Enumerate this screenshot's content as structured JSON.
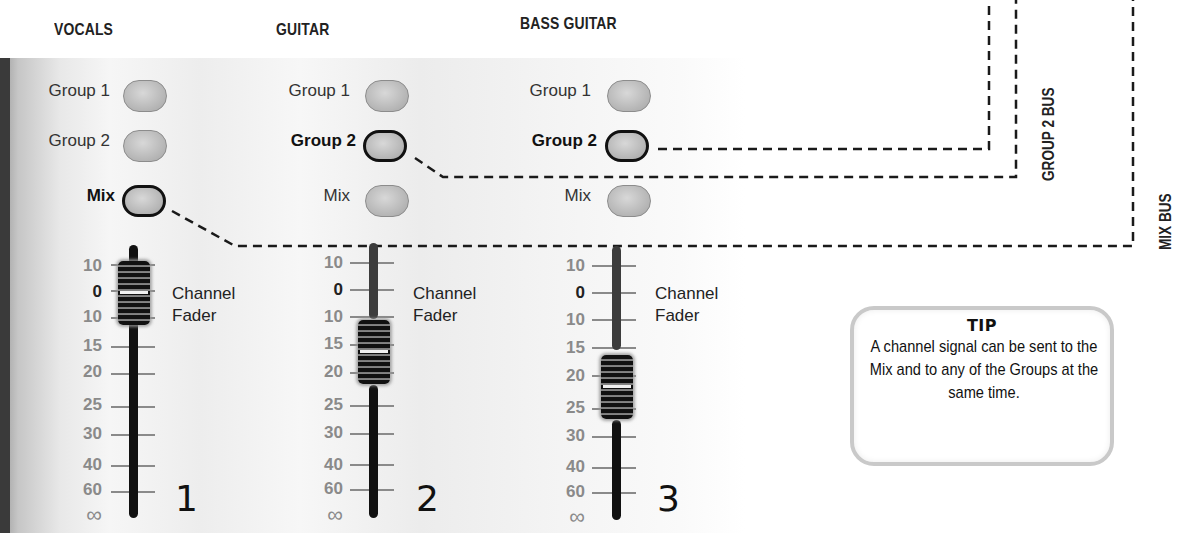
{
  "channels": [
    {
      "id": 1,
      "title": "VOCALS",
      "number": "1",
      "routing": [
        {
          "label": "Group 1",
          "active": false
        },
        {
          "label": "Group 2",
          "active": false
        },
        {
          "label": "Mix",
          "active": true
        }
      ],
      "fader_label_line1": "Channel",
      "fader_label_line2": "Fader",
      "fader_position_db": "0"
    },
    {
      "id": 2,
      "title": "GUITAR",
      "number": "2",
      "routing": [
        {
          "label": "Group 1",
          "active": false
        },
        {
          "label": "Group 2",
          "active": true
        },
        {
          "label": "Mix",
          "active": false
        }
      ],
      "fader_label_line1": "Channel",
      "fader_label_line2": "Fader",
      "fader_position_db": "15"
    },
    {
      "id": 3,
      "title": "BASS GUITAR",
      "number": "3",
      "routing": [
        {
          "label": "Group 1",
          "active": false
        },
        {
          "label": "Group 2",
          "active": true
        },
        {
          "label": "Mix",
          "active": false
        }
      ],
      "fader_label_line1": "Channel",
      "fader_label_line2": "Fader",
      "fader_position_db": "20"
    }
  ],
  "fader_scale": [
    "10",
    "0",
    "10",
    "15",
    "20",
    "25",
    "30",
    "40",
    "60",
    "∞"
  ],
  "buses": {
    "group2": "GROUP 2 BUS",
    "mix": "MIX BUS"
  },
  "tip": {
    "title": "TIP",
    "text": "A channel signal can be sent to the Mix and to any of the Groups at the same time."
  },
  "colors": {
    "active_outline": "#111111",
    "button_fill": "#bcbcbc",
    "scale_text": "#8a8a8a",
    "wire": "#1a1a1a",
    "tip_border": "#c9c9c9"
  }
}
